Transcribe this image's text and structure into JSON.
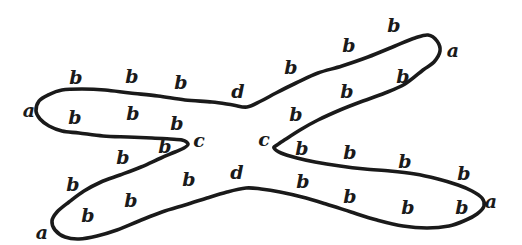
{
  "diagram": {
    "type": "hand-drawn-closed-curve",
    "background_color": "#ffffff",
    "ink_color": "#1a1a1a",
    "stroke_width": 3.6,
    "canvas": {
      "width": 522,
      "height": 245
    },
    "curve_points": [
      [
        36,
        111
      ],
      [
        39,
        101
      ],
      [
        48,
        95
      ],
      [
        62,
        90
      ],
      [
        82,
        89
      ],
      [
        105,
        90
      ],
      [
        130,
        93
      ],
      [
        158,
        96
      ],
      [
        185,
        100
      ],
      [
        212,
        102
      ],
      [
        233,
        105
      ],
      [
        247,
        107
      ],
      [
        261,
        101
      ],
      [
        276,
        93
      ],
      [
        296,
        83
      ],
      [
        318,
        73
      ],
      [
        342,
        66
      ],
      [
        368,
        57
      ],
      [
        395,
        46
      ],
      [
        415,
        38
      ],
      [
        428,
        35
      ],
      [
        437,
        41
      ],
      [
        440,
        51
      ],
      [
        434,
        62
      ],
      [
        423,
        70
      ],
      [
        405,
        84
      ],
      [
        385,
        93
      ],
      [
        363,
        101
      ],
      [
        340,
        110
      ],
      [
        318,
        120
      ],
      [
        300,
        130
      ],
      [
        286,
        139
      ],
      [
        277,
        145
      ],
      [
        274,
        148
      ],
      [
        281,
        153
      ],
      [
        297,
        158
      ],
      [
        315,
        162
      ],
      [
        340,
        166
      ],
      [
        365,
        169
      ],
      [
        390,
        171
      ],
      [
        415,
        174
      ],
      [
        438,
        179
      ],
      [
        458,
        185
      ],
      [
        472,
        191
      ],
      [
        482,
        198
      ],
      [
        484,
        206
      ],
      [
        477,
        214
      ],
      [
        466,
        220
      ],
      [
        449,
        226
      ],
      [
        427,
        228
      ],
      [
        403,
        226
      ],
      [
        377,
        220
      ],
      [
        351,
        212
      ],
      [
        326,
        204
      ],
      [
        302,
        197
      ],
      [
        280,
        192
      ],
      [
        261,
        189
      ],
      [
        246,
        188
      ],
      [
        227,
        192
      ],
      [
        207,
        198
      ],
      [
        185,
        205
      ],
      [
        162,
        212
      ],
      [
        139,
        221
      ],
      [
        117,
        230
      ],
      [
        97,
        236
      ],
      [
        79,
        239
      ],
      [
        65,
        237
      ],
      [
        55,
        230
      ],
      [
        52,
        221
      ],
      [
        57,
        212
      ],
      [
        69,
        202
      ],
      [
        84,
        191
      ],
      [
        101,
        182
      ],
      [
        120,
        175
      ],
      [
        141,
        167
      ],
      [
        161,
        158
      ],
      [
        175,
        152
      ],
      [
        184,
        148
      ],
      [
        188,
        144
      ],
      [
        182,
        140
      ],
      [
        170,
        139
      ],
      [
        152,
        138
      ],
      [
        128,
        137
      ],
      [
        103,
        136
      ],
      [
        79,
        133
      ],
      [
        62,
        131
      ],
      [
        49,
        126
      ],
      [
        40,
        119
      ]
    ],
    "labels": [
      {
        "text": "a",
        "x": 29,
        "y": 110
      },
      {
        "text": "a",
        "x": 453,
        "y": 50
      },
      {
        "text": "a",
        "x": 491,
        "y": 201
      },
      {
        "text": "a",
        "x": 42,
        "y": 232
      },
      {
        "text": "c",
        "x": 199,
        "y": 140
      },
      {
        "text": "c",
        "x": 264,
        "y": 139
      },
      {
        "text": "d",
        "x": 238,
        "y": 91
      },
      {
        "text": "d",
        "x": 237,
        "y": 172
      },
      {
        "text": "b",
        "x": 76,
        "y": 77
      },
      {
        "text": "b",
        "x": 132,
        "y": 76
      },
      {
        "text": "b",
        "x": 181,
        "y": 82
      },
      {
        "text": "b",
        "x": 291,
        "y": 67
      },
      {
        "text": "b",
        "x": 349,
        "y": 45
      },
      {
        "text": "b",
        "x": 394,
        "y": 25
      },
      {
        "text": "b",
        "x": 75,
        "y": 117
      },
      {
        "text": "b",
        "x": 133,
        "y": 113
      },
      {
        "text": "b",
        "x": 177,
        "y": 123
      },
      {
        "text": "b",
        "x": 347,
        "y": 91
      },
      {
        "text": "b",
        "x": 403,
        "y": 76
      },
      {
        "text": "b",
        "x": 296,
        "y": 114
      },
      {
        "text": "b",
        "x": 165,
        "y": 146
      },
      {
        "text": "b",
        "x": 302,
        "y": 148
      },
      {
        "text": "b",
        "x": 189,
        "y": 179
      },
      {
        "text": "b",
        "x": 73,
        "y": 184
      },
      {
        "text": "b",
        "x": 123,
        "y": 157
      },
      {
        "text": "b",
        "x": 350,
        "y": 152
      },
      {
        "text": "b",
        "x": 405,
        "y": 161
      },
      {
        "text": "b",
        "x": 464,
        "y": 173
      },
      {
        "text": "b",
        "x": 88,
        "y": 215
      },
      {
        "text": "b",
        "x": 131,
        "y": 200
      },
      {
        "text": "b",
        "x": 303,
        "y": 181
      },
      {
        "text": "b",
        "x": 350,
        "y": 196
      },
      {
        "text": "b",
        "x": 408,
        "y": 207
      },
      {
        "text": "b",
        "x": 462,
        "y": 207
      }
    ]
  }
}
